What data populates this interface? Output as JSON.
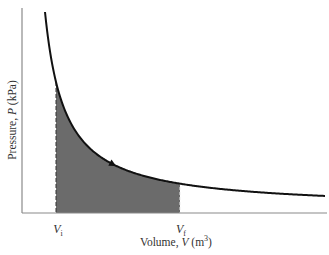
{
  "chart_data": {
    "type": "area",
    "title": "",
    "xlabel": "Volume, V (m^3)",
    "ylabel": "Pressure, P (kPa)",
    "x_ticks": [
      "Vi",
      "Vf"
    ],
    "grid": false,
    "legend": null,
    "curve": "hyperbola P ∝ 1/V, decreasing",
    "shaded_region": {
      "from": "Vi",
      "to": "Vf",
      "color": "#6b6b6b"
    },
    "arrow": {
      "direction": "toward increasing V (down along curve)"
    }
  },
  "axes": {
    "ylabel_prefix": "Pressure, ",
    "ylabel_var": "P",
    "ylabel_unit": " (kPa)",
    "xlabel_prefix": "Volume, ",
    "xlabel_var": "V",
    "xlabel_unit_open": " (m",
    "xlabel_unit_sup": "3",
    "xlabel_unit_close": ")"
  },
  "ticks": {
    "vi_main": "V",
    "vi_sub": "i",
    "vf_main": "V",
    "vf_sub": "f"
  },
  "colors": {
    "curve": "#111111",
    "shade": "#6b6b6b",
    "axis": "#8a8a8a"
  }
}
